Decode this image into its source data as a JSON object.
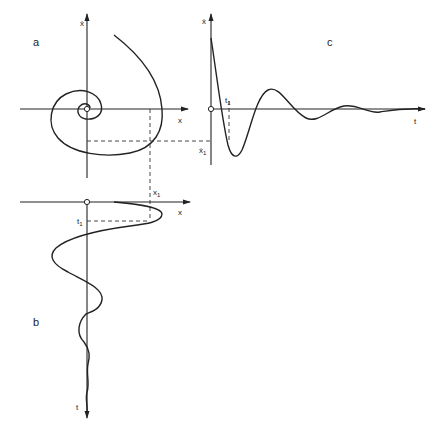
{
  "figure": {
    "panels": [
      {
        "id": "a",
        "label": "a",
        "type": "phase-portrait",
        "x_axis": "x",
        "y_axis": "ẋ",
        "description": "Spiral trajectory converging to origin"
      },
      {
        "id": "b",
        "label": "b",
        "type": "displacement-vs-time",
        "x_axis": "x",
        "y_axis": "t",
        "description": "Damped oscillation of x with time running downward"
      },
      {
        "id": "c",
        "label": "c",
        "type": "velocity-vs-time",
        "x_axis": "t",
        "y_axis": "ẋ",
        "description": "Damped oscillation of velocity over time"
      }
    ],
    "labels": {
      "panel_a": "a",
      "panel_b": "b",
      "panel_c": "c",
      "a_x_axis": "x",
      "a_y_axis": "ẋ",
      "b_x_axis": "x",
      "b_t_axis": "t",
      "b_x1": "x",
      "b_x1_sub": "1",
      "b_t1": "t",
      "b_t1_sub": "1",
      "c_t_axis": "t",
      "c_y_axis": "ẋ",
      "c_t1": "t",
      "c_t1_sub": "1",
      "c_xdot1": "ẋ",
      "c_xdot1_sub": "1"
    },
    "colors": {
      "ink": "#222222",
      "background": "#ffffff"
    }
  }
}
